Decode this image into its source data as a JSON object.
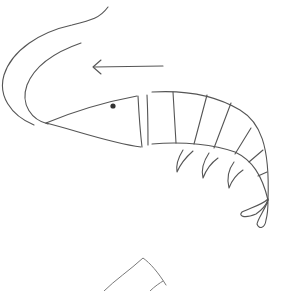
{
  "drawing": {
    "subject": "shrimp sketch",
    "style": "hand-drawn line art",
    "stroke_color": "#555555",
    "background": "#ffffff",
    "elements": [
      {
        "name": "antenna-outer",
        "description": "long curved antenna"
      },
      {
        "name": "antenna-inner",
        "description": "inner curved antenna"
      },
      {
        "name": "head",
        "description": "triangular pointed head"
      },
      {
        "name": "eye",
        "description": "small dark dot"
      },
      {
        "name": "body-segments",
        "count": 7
      },
      {
        "name": "legs",
        "count": 4
      },
      {
        "name": "tail-fan",
        "description": "two-lobed tail"
      },
      {
        "name": "direction-arrow",
        "direction": "left"
      },
      {
        "name": "partial-shape",
        "description": "partial sketch at bottom edge"
      }
    ]
  }
}
